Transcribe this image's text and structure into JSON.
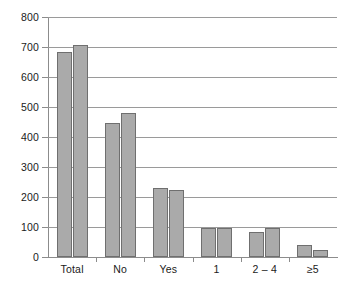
{
  "chart_data": {
    "type": "bar",
    "title": "",
    "subtitle": "",
    "xlabel": "",
    "ylabel": "",
    "categories": [
      "Total",
      "No",
      "Yes",
      "1",
      "2 – 4",
      "≥5"
    ],
    "series": [
      {
        "name": "Series 1",
        "values": [
          683,
          446,
          231,
          97,
          85,
          40
        ]
      },
      {
        "name": "Series 2",
        "values": [
          707,
          480,
          222,
          97,
          97,
          22
        ]
      }
    ],
    "ylim": [
      0,
      800
    ],
    "yticks": [
      0,
      100,
      200,
      300,
      400,
      500,
      600,
      700,
      800
    ],
    "ytick_labels": [
      "0",
      "100",
      "200",
      "300",
      "400",
      "500",
      "600",
      "700",
      "800"
    ],
    "grid": true,
    "grid_axis": "y",
    "legend": false,
    "legend_position": "none",
    "bar_fill_color": "#aaaaaa",
    "bar_edge_color": "#6f6f6f",
    "axis_color": "#8c8c8c",
    "grid_color": "#9a9a9a",
    "background_color": "#ffffff",
    "annotations": []
  }
}
